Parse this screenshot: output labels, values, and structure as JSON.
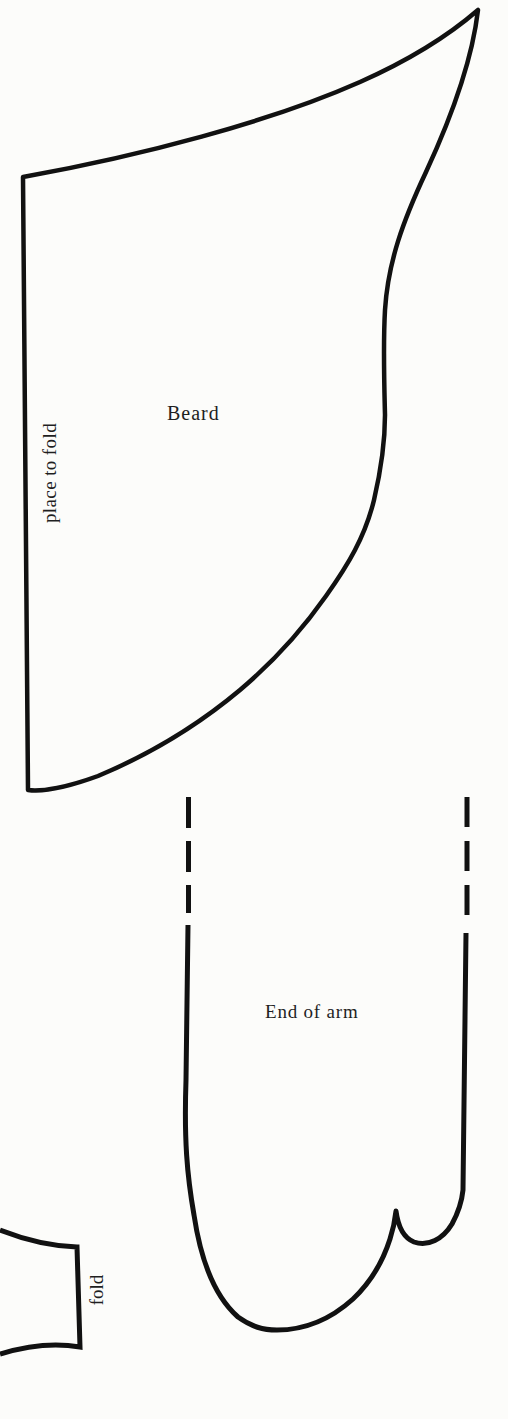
{
  "page": {
    "type": "craft pattern page",
    "background_color": "#fcfcfa",
    "line_color": "#111111",
    "text_color": "#1f1f1f"
  },
  "pieces": {
    "beard": {
      "label": "Beard",
      "fold_edge_label": "place to fold"
    },
    "end_of_arm": {
      "label": "End of arm"
    },
    "fold_tab": {
      "label": "fold"
    }
  }
}
